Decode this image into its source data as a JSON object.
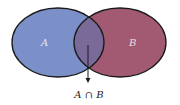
{
  "diagram": {
    "type": "venn",
    "sets": [
      {
        "label": "A",
        "color": "#7b8fc9"
      },
      {
        "label": "B",
        "color": "#a25a72"
      }
    ],
    "intersection": {
      "label": "A ∩ B",
      "color": "#7a6a9a"
    },
    "outline_color": "#1a1a1a"
  }
}
